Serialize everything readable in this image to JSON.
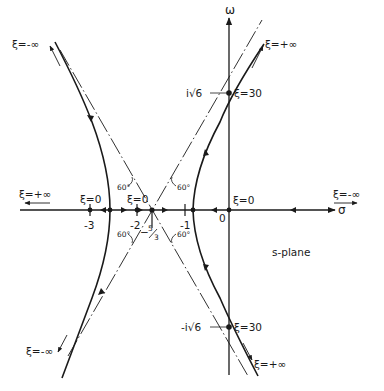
{
  "figure": {
    "plane_label": "s-plane",
    "axes": {
      "real_label": "σ",
      "imag_label": "ω",
      "origin_label": "0"
    },
    "ticks": [
      {
        "value": -3,
        "label": "-3"
      },
      {
        "value": -2,
        "label": "-2"
      },
      {
        "value": -1,
        "label": "-1"
      }
    ],
    "centroid": {
      "value": -1.6667,
      "label_minus": "−",
      "label_num": "5",
      "label_den": "3"
    },
    "angles": [
      "60°",
      "60°",
      "60°",
      "60°"
    ],
    "poles_labels": [
      {
        "label": "ξ=0",
        "at": -3
      },
      {
        "label": "ξ=0",
        "at": -2
      },
      {
        "label": "ξ=0",
        "at": 0
      }
    ],
    "crossings": [
      {
        "imag_label": "i√6",
        "xi_label": "ξ=30"
      },
      {
        "imag_label": "-i√6",
        "xi_label": "ξ=30"
      }
    ],
    "asymptote_ends": {
      "upper_left": "ξ=-∞",
      "upper_right": "ξ=+∞",
      "lower_left": "ξ=-∞",
      "lower_right": "ξ=+∞",
      "real_left": "ξ=+∞",
      "real_right": "ξ=-∞"
    },
    "colors": {
      "ink": "#1a1a1a",
      "background": "#ffffff"
    }
  }
}
